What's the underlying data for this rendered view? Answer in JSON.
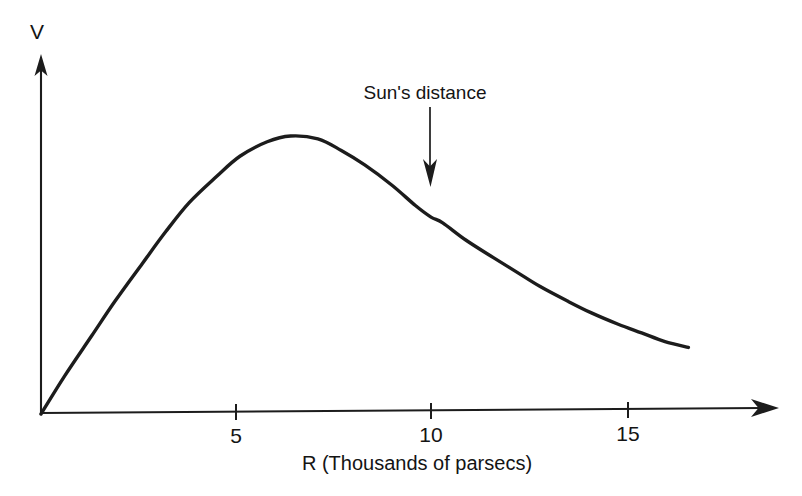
{
  "chart_data": {
    "type": "line",
    "title": "",
    "subtitle": "",
    "xlabel": "R  (Thousands of parsecs)",
    "ylabel": "V",
    "xlim": [
      0,
      17.3
    ],
    "ylim": [
      0,
      1.15
    ],
    "grid": false,
    "legend": null,
    "x_ticks": [
      {
        "value": 5,
        "label": "5"
      },
      {
        "value": 10,
        "label": "10"
      },
      {
        "value": 15,
        "label": "15"
      }
    ],
    "y_ticks": [],
    "series": [
      {
        "name": "Galactic rotation curve",
        "color": "#1c1c1c",
        "x": [
          0.0,
          0.6,
          1.3,
          1.9,
          2.6,
          3.2,
          3.8,
          4.5,
          5.1,
          5.8,
          6.4,
          7.1,
          7.7,
          8.3,
          9.0,
          9.6,
          10.0,
          10.3,
          10.9,
          11.6,
          12.2,
          12.8,
          13.5,
          14.1,
          14.8,
          15.4,
          16.0,
          16.6
        ],
        "y": [
          0.0,
          0.13,
          0.27,
          0.39,
          0.52,
          0.63,
          0.73,
          0.82,
          0.89,
          0.94,
          0.96,
          0.95,
          0.91,
          0.86,
          0.79,
          0.72,
          0.68,
          0.66,
          0.6,
          0.54,
          0.49,
          0.44,
          0.39,
          0.35,
          0.31,
          0.28,
          0.25,
          0.23
        ]
      }
    ],
    "annotations": [
      {
        "label": "Sun's distance",
        "x": 10.0,
        "points_to_y": 0.86,
        "arrow": "down"
      }
    ]
  },
  "axes": {
    "y_axis_label": "V",
    "x_axis_label": "R  (Thousands of parsecs)"
  },
  "annotation": {
    "sun_label": "Sun's distance"
  },
  "ticks": {
    "t5": "5",
    "t10": "10",
    "t15": "15"
  },
  "colors": {
    "ink": "#1c1c1c",
    "background": "#ffffff"
  }
}
